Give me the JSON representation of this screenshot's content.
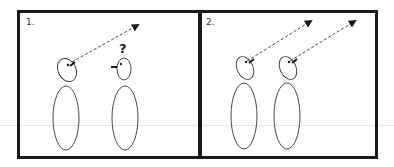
{
  "figure": {
    "type": "gaze-following-diagram",
    "colors": {
      "frame": "#1a1a1a",
      "stroke": "#333333",
      "guide_line": "#e6e6e6",
      "background": "#ffffff"
    },
    "panels": [
      {
        "label": "1.",
        "figures": [
          {
            "role": "looker",
            "gaze": "up-right",
            "has_arrow": true
          },
          {
            "role": "observer",
            "gaze": "left",
            "has_arrow": false,
            "annotation": "?"
          }
        ]
      },
      {
        "label": "2.",
        "figures": [
          {
            "role": "looker",
            "gaze": "up-right",
            "has_arrow": true
          },
          {
            "role": "follower",
            "gaze": "up-right",
            "has_arrow": true
          }
        ]
      }
    ]
  }
}
